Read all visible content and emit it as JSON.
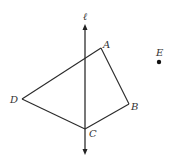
{
  "diagram": {
    "line": {
      "label": "ℓ",
      "color": "#555555"
    },
    "vertices": [
      {
        "id": "A",
        "label": "A"
      },
      {
        "id": "B",
        "label": "B"
      },
      {
        "id": "C",
        "label": "C"
      },
      {
        "id": "D",
        "label": "D"
      }
    ],
    "point": {
      "id": "E",
      "label": "E"
    },
    "edges": [
      [
        "A",
        "B"
      ],
      [
        "B",
        "C"
      ],
      [
        "C",
        "D"
      ],
      [
        "D",
        "A"
      ]
    ],
    "edge_color": "#2a2a2a",
    "label_color": "#333333"
  }
}
